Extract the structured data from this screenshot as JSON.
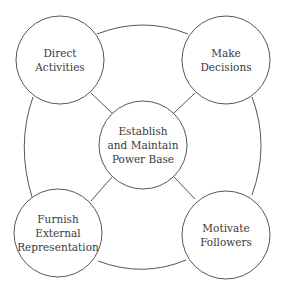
{
  "diagram": {
    "type": "hub-and-spoke cycle",
    "colors": {
      "stroke": "#555555",
      "text": "#3a3a3a",
      "background": "#ffffff"
    },
    "center": {
      "id": "center",
      "label": "Establish\nand Maintain\nPower Base"
    },
    "nodes": [
      {
        "id": "top-left",
        "label": "Direct\nActivities"
      },
      {
        "id": "top-right",
        "label": "Make\nDecisions"
      },
      {
        "id": "bottom-left",
        "label": "Furnish\nExternal\nRepresentation"
      },
      {
        "id": "bottom-right",
        "label": "Motivate\nFollowers"
      }
    ],
    "edges": [
      {
        "from": "center",
        "to": "top-left"
      },
      {
        "from": "center",
        "to": "top-right"
      },
      {
        "from": "center",
        "to": "bottom-left"
      },
      {
        "from": "center",
        "to": "bottom-right"
      },
      {
        "from": "top-left",
        "to": "top-right",
        "style": "arc"
      },
      {
        "from": "top-right",
        "to": "bottom-right",
        "style": "arc"
      },
      {
        "from": "bottom-right",
        "to": "bottom-left",
        "style": "arc"
      },
      {
        "from": "bottom-left",
        "to": "top-left",
        "style": "arc"
      }
    ]
  }
}
